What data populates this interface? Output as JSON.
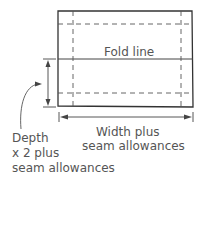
{
  "diagram": {
    "fold_label": "Fold line",
    "width_label": [
      "Width plus",
      "seam allowances"
    ],
    "depth_label": [
      "Depth",
      "x 2 plus",
      "seam allowances"
    ]
  }
}
